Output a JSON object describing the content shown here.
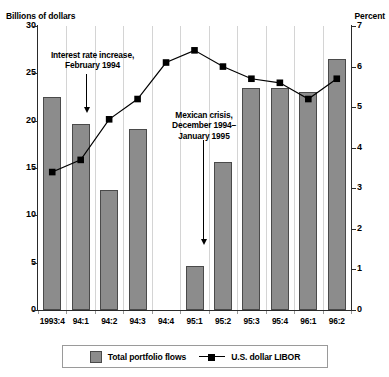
{
  "left_axis_title": "Billions of dollars",
  "right_axis_title": "Percent",
  "top_caption": "",
  "annotations": [
    {
      "name": "interest-rate-increase",
      "text": "Interest rate increase,\nFebruary 1994"
    },
    {
      "name": "mexican-crisis",
      "text": "Mexican crisis,\nDecember 1994–\nJanuary 1995"
    }
  ],
  "legend": {
    "bar_label": "Total portfolio flows",
    "line_label": "U.S. dollar LIBOR"
  },
  "colors": {
    "bar_fill": "#8c8c8c",
    "bar_stroke": "#4a4a4a",
    "line": "#000000",
    "marker": "#000000",
    "gridline": "#d4d4d4",
    "axis": "#2a2a2a"
  },
  "chart_data": {
    "type": "bar",
    "title": "",
    "subtitle": "",
    "xlabel": "",
    "ylabel": "Billions of dollars",
    "y2label": "Percent",
    "grid": "vertical",
    "legend_position": "bottom",
    "categories": [
      "1993:4",
      "94:1",
      "94:2",
      "94:3",
      "94:4",
      "95:1",
      "95:2",
      "95:3",
      "95:4",
      "96:1",
      "96:2"
    ],
    "ylim": [
      0,
      30
    ],
    "yticks": [
      0,
      5,
      10,
      15,
      20,
      25,
      30
    ],
    "y2lim": [
      0,
      7
    ],
    "y2ticks": [
      0,
      1,
      2,
      3,
      4,
      5,
      6,
      7
    ],
    "series": [
      {
        "name": "Total portfolio flows",
        "type": "bar",
        "axis": "left",
        "unit": "Billions of dollars",
        "values": [
          22.5,
          19.7,
          12.7,
          19.1,
          null,
          4.7,
          15.6,
          23.5,
          23.4,
          23.0,
          26.5
        ]
      },
      {
        "name": "U.S. dollar LIBOR",
        "type": "line",
        "axis": "right",
        "unit": "Percent",
        "values": [
          3.4,
          3.7,
          4.7,
          5.2,
          6.1,
          6.4,
          6.0,
          5.7,
          5.6,
          5.2,
          5.7
        ]
      }
    ]
  }
}
